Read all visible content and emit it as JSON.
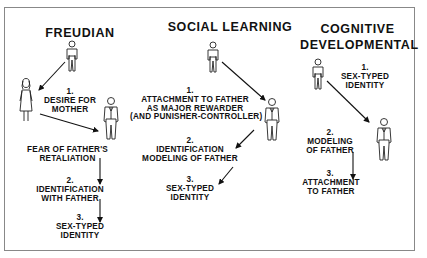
{
  "diagram": {
    "columns": [
      {
        "title": "FREUDIAN",
        "steps": [
          {
            "number": "1.",
            "text": "DESIRE FOR\nMOTHER"
          },
          {
            "number": "",
            "text": "FEAR OF FATHER'S\nRETALIATION"
          },
          {
            "number": "2.",
            "text": "IDENTIFICATION\nWITH FATHER"
          },
          {
            "number": "3.",
            "text": "SEX-TYPED\nIDENTITY"
          }
        ],
        "figures": [
          "boy",
          "mother",
          "father"
        ]
      },
      {
        "title": "SOCIAL LEARNING",
        "steps": [
          {
            "number": "1.",
            "text": "ATTACHMENT TO FATHER\nAS MAJOR REWARDER\n(AND PUNISHER-CONTROLLER)"
          },
          {
            "number": "2.",
            "text": "IDENTIFICATION\nMODELING OF FATHER"
          },
          {
            "number": "3.",
            "text": "SEX-TYPED\nIDENTITY"
          }
        ],
        "figures": [
          "boy",
          "father"
        ]
      },
      {
        "title": "COGNITIVE\nDEVELOPMENTAL",
        "steps": [
          {
            "number": "1.",
            "text": "SEX-TYPED\nIDENTITY"
          },
          {
            "number": "2.",
            "text": "MODELING\nOF FATHER"
          },
          {
            "number": "3.",
            "text": "ATTACHMENT\nTO FATHER"
          }
        ],
        "figures": [
          "boy",
          "father"
        ]
      }
    ],
    "colors": {
      "ink": "#111111",
      "border": "#888888",
      "background": "#ffffff"
    }
  }
}
